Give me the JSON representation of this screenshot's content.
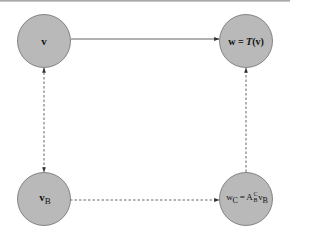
{
  "diagram": {
    "type": "commutative-diagram",
    "colors": {
      "node_fill": "#b9b9b9",
      "node_stroke": "#6e6e6e",
      "edge": "#444444",
      "background": "#ffffff"
    },
    "nodes": [
      {
        "id": "v",
        "label": "v",
        "position": "top-left"
      },
      {
        "id": "w",
        "label_main": "w",
        "label_eq": " = ",
        "label_func": "T",
        "label_arg": "(v)",
        "position": "top-right"
      },
      {
        "id": "vB",
        "label_main": "v",
        "label_sub": "B",
        "position": "bottom-left"
      },
      {
        "id": "wC",
        "label_main": "w",
        "label_sub": "C",
        "label_eq": " = A",
        "label_sup_right": "C",
        "label_sub_right": "B",
        "label_tail": "v",
        "label_tail_sub": "B",
        "position": "bottom-right"
      }
    ],
    "edges": [
      {
        "from": "v",
        "to": "w",
        "style": "solid",
        "arrow": "end"
      },
      {
        "from": "v",
        "to": "vB",
        "style": "dashed",
        "arrow": "both"
      },
      {
        "from": "vB",
        "to": "wC",
        "style": "dashed",
        "arrow": "end"
      },
      {
        "from": "wC",
        "to": "w",
        "style": "dashed",
        "arrow": "end"
      }
    ]
  }
}
